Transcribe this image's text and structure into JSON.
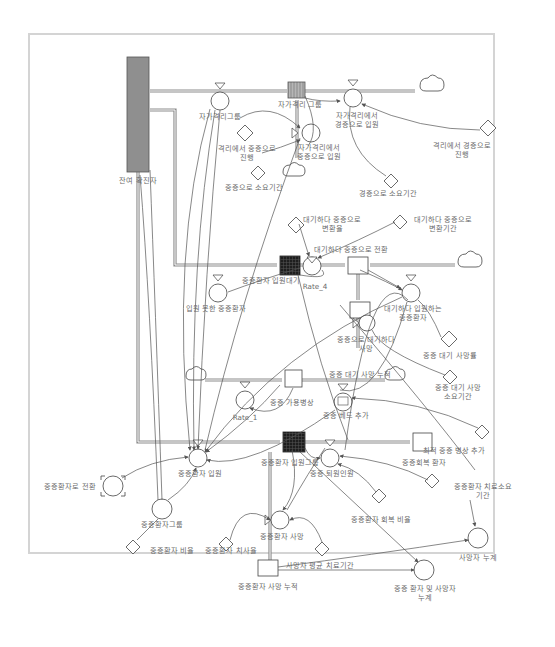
{
  "title_fragment": "(title text cut off at top edge)",
  "diagram": {
    "type": "stock-and-flow system dynamics model",
    "stocks": {
      "confirmed_remaining": "잔여 확진자",
      "self_isolation_group": "자가격리 그룹",
      "severe_waiting": "중증환자 입원대기",
      "severe_hospitalized": "중증환자 입원그룹",
      "severe_wait_death_cum": "중증 대기 사망 누적",
      "severe_recovered": "중증회복 환자",
      "severe_death_cum": "중증환자 사망 누적",
      "severe_beds_available": "중증 가용병상"
    },
    "flows": {
      "self_isolation_group_flow": "자가격리그룹",
      "self_iso_to_mild_admission": "자가격리에서\n경증으로 입원",
      "self_iso_to_severe_admission": "자가격리에서\n중증으로 입원",
      "not_admitted_severe": "입원 못한 중증환자",
      "rate_4": "Rate_4",
      "waiting_to_severe_transition": "대기하다 중증으로 전환",
      "waiting_admitted_severe": "대기하다 입원하는\n중증환자",
      "severe_wait_death": "중증으로 대기하다\n사망",
      "rate_1": "Rate_1",
      "severe_bed_add": "중증 베드 추가",
      "severe_admission": "중증환자 입원",
      "severe_discharge": "중증 퇴원인원",
      "severe_death": "중증환자 사망"
    },
    "auxiliaries": {
      "to_severe_transition": "중증환자로 전환",
      "severe_group": "중증환자그룹",
      "death_cum": "사망자 누계",
      "severe_and_death_cum": "중증 환자 및 사망자\n누계"
    },
    "constants": {
      "iso_to_severe_progress": "격리에서 중증으로\n진행",
      "iso_to_mild_progress": "격리에서 경증으로\n진행",
      "severe_duration": "중증으로 소요기간",
      "mild_duration": "경증으로 소요기간",
      "waiting_severe_rate": "대기하다 중증으로\n변환율",
      "waiting_severe_period": "대기하다 중증으로\n변환기간",
      "severe_wait_death_rate": "중증 대기 사망률",
      "severe_wait_death_period": "중증 대기 사망\n소요기간",
      "max_severe_bed_add": "최적 중증 병상 추가",
      "severe_treatment_period": "중증환자 치료소요\n기간",
      "severe_recovery_ratio": "중증환자 회복 비율",
      "severe_ratio": "중증환자 비율",
      "severe_fatality": "중증환자 치사율",
      "death_avg_treatment": "사망자 평균 치료기간"
    }
  },
  "colors": {
    "frame_border": "#d4d4d4",
    "stock_gray": "#8f8f8f",
    "stock_dark": "#2a2a2a",
    "pipe": "#8c8c8c",
    "label": "#6a6a6a"
  }
}
